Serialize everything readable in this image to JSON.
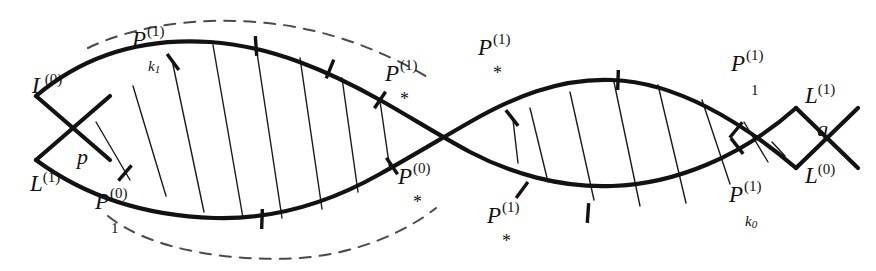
{
  "figure": {
    "type": "mathematical-diagram",
    "background_color": "#ffffff",
    "stroke_color": "#121212",
    "dash_color": "#4a4a4a",
    "hatch_color": "#1a1a1a"
  },
  "labels": {
    "left_upper_line": {
      "base": "L",
      "sup": "(0)"
    },
    "left_lower_line": {
      "base": "L",
      "sup": "(1)"
    },
    "left_intersection": {
      "base": "p"
    },
    "right_upper_line": {
      "base": "L",
      "sup": "(1)"
    },
    "right_lower_line": {
      "base": "L",
      "sup": "(0)"
    },
    "right_intersection": {
      "base": "q"
    },
    "p_k1": {
      "base": "P",
      "sup": "(1)",
      "sub": "k",
      "subsub": "1"
    },
    "p_1_lower_left": {
      "base": "P",
      "sup": "(0)",
      "sub": "1"
    },
    "p_star_upper_mid": {
      "base": "P",
      "sup": "(1)",
      "sub": "*"
    },
    "p_star_lower_mid": {
      "base": "P",
      "sup": "(0)",
      "sub": "*"
    },
    "p_star_upper_right": {
      "base": "P",
      "sup": "(1)",
      "sub": "*"
    },
    "p_star_lower_right": {
      "base": "P",
      "sup": "(1)",
      "sub": "*"
    },
    "p_1_upper_right": {
      "base": "P",
      "sup": "(1)",
      "sub": "1"
    },
    "p_k0": {
      "base": "P",
      "sup": "(1)",
      "sub": "k",
      "subsub": "0"
    }
  },
  "geometry": {
    "curve_upper_path": "M 36,96 C 90,50 150,38 210,42 C 272,46 330,72 380,100 C 412,118 440,136 470,152 C 510,173 560,188 612,186 C 676,184 742,156 796,108",
    "curve_lower_path": "M 36,160 C 90,200 152,216 214,218 C 278,220 334,200 380,174 C 414,155 442,138 470,122 C 512,98 558,78 612,80 C 676,82 742,122 796,168",
    "dash_upper_path": "M 88,48 C 150,18 240,14 310,30 C 356,40 400,60 432,80",
    "dash_lower_path": "M 108,216 C 150,250 230,262 300,258 C 356,254 406,232 436,208",
    "transversal_left_a": "M 36,96 L 110,160",
    "transversal_left_b": "M 36,160 L 110,96",
    "transversal_right_a": "M 796,108 L 858,168",
    "transversal_right_b": "M 796,168 L 858,108",
    "hatch_lines_left": [
      "M 96,122 L 130,180",
      "M 133,86 L 166,196",
      "M 172,60 L 204,212",
      "M 213,45 L 243,218",
      "M 256,46 L 282,218",
      "M 300,58 L 322,209",
      "M 342,78 L 358,192",
      "M 380,101 L 390,170"
    ],
    "hatch_lines_right": [
      "M 513,120 L 518,163",
      "M 530,108 L 548,182",
      "M 570,92 L 594,200",
      "M 614,82 L 640,206",
      "M 658,85 L 686,203",
      "M 702,100 L 730,184",
      "M 744,122 L 768,162",
      "M 772,142 L 785,156"
    ],
    "tick_marks": [
      {
        "x": 173,
        "y": 62,
        "angle": -36
      },
      {
        "x": 256,
        "y": 46,
        "angle": -4
      },
      {
        "x": 330,
        "y": 69,
        "angle": 22
      },
      {
        "x": 380,
        "y": 100,
        "angle": 34
      },
      {
        "x": 125,
        "y": 173,
        "angle": 41
      },
      {
        "x": 262,
        "y": 219,
        "angle": 2
      },
      {
        "x": 392,
        "y": 166,
        "angle": -34
      },
      {
        "x": 512,
        "y": 118,
        "angle": -38
      },
      {
        "x": 618,
        "y": 80,
        "angle": 2
      },
      {
        "x": 736,
        "y": 130,
        "angle": 39
      },
      {
        "x": 522,
        "y": 190,
        "angle": 36
      },
      {
        "x": 588,
        "y": 213,
        "angle": 4
      },
      {
        "x": 737,
        "y": 146,
        "angle": -38
      }
    ]
  }
}
